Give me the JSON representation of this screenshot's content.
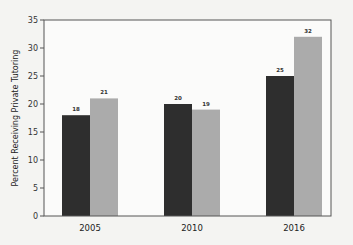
{
  "chart_data": {
    "type": "bar",
    "title": "",
    "xlabel": "",
    "ylabel": "Percent Receiving Private Tutoring",
    "categories": [
      "2005",
      "2010",
      "2016"
    ],
    "series": [
      {
        "name": "Series 1",
        "color": "#2e2e2e",
        "values": [
          18,
          20,
          25
        ]
      },
      {
        "name": "Series 2",
        "color": "#ababab",
        "values": [
          21,
          19,
          32
        ]
      }
    ],
    "ylim": [
      0,
      35
    ],
    "yticks": [
      0,
      5,
      10,
      15,
      20,
      25,
      30,
      35
    ],
    "grid": false,
    "legend": "none",
    "data_labels": true
  }
}
